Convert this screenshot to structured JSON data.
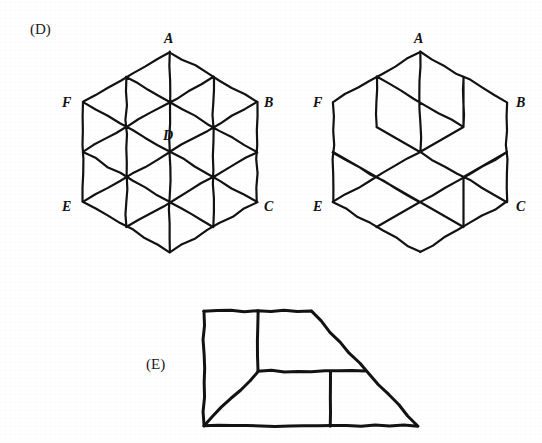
{
  "page": {
    "width": 542,
    "height": 443,
    "background_color": "#ffffff",
    "ink_color": "#121212"
  },
  "panels": [
    {
      "id": "panel-d",
      "label": "(D)",
      "label_x": 30,
      "label_y": 34
    },
    {
      "id": "panel-e",
      "label": "(E)",
      "label_y": 369,
      "label_x": 146
    }
  ],
  "figures": {
    "hexagon": {
      "name": "rhombille-hexagon",
      "stroke_width": 2.2,
      "center": {
        "x": 170,
        "y": 152
      },
      "radius": 100,
      "vertex_labels": [
        {
          "text": "A",
          "x": 164,
          "y": 43
        },
        {
          "text": "B",
          "x": 264,
          "y": 107
        },
        {
          "text": "C",
          "x": 264,
          "y": 211
        },
        {
          "text": "D",
          "x": 163,
          "y": 140
        },
        {
          "text": "E",
          "x": 62,
          "y": 211
        },
        {
          "text": "F",
          "x": 62,
          "y": 107
        }
      ],
      "outer_vertices": [
        {
          "name": "A",
          "x": 170,
          "y": 52
        },
        {
          "name": "B",
          "x": 257,
          "y": 102
        },
        {
          "name": "C",
          "x": 257,
          "y": 202
        },
        {
          "name": "S",
          "x": 170,
          "y": 252
        },
        {
          "name": "E",
          "x": 83,
          "y": 202
        },
        {
          "name": "F",
          "x": 83,
          "y": 102
        }
      ]
    },
    "cube": {
      "name": "isometric-cube",
      "stroke_width": 2.2,
      "center": {
        "x": 420,
        "y": 152
      },
      "radius": 100,
      "vertex_labels": [
        {
          "text": "A",
          "x": 414,
          "y": 43
        },
        {
          "text": "B",
          "x": 516,
          "y": 107
        },
        {
          "text": "C",
          "x": 516,
          "y": 211
        },
        {
          "text": "E",
          "x": 313,
          "y": 211
        },
        {
          "text": "F",
          "x": 313,
          "y": 107
        }
      ],
      "outer_vertices": [
        {
          "name": "A",
          "x": 420,
          "y": 52
        },
        {
          "name": "B",
          "x": 507,
          "y": 102
        },
        {
          "name": "C",
          "x": 507,
          "y": 202
        },
        {
          "name": "S",
          "x": 420,
          "y": 252
        },
        {
          "name": "E",
          "x": 333,
          "y": 202
        },
        {
          "name": "F",
          "x": 333,
          "y": 102
        }
      ]
    },
    "trapezoid": {
      "name": "trapezoid-figure",
      "stroke_width": 3.0,
      "outline": [
        {
          "x": 204,
          "y": 311
        },
        {
          "x": 311,
          "y": 311
        },
        {
          "x": 418,
          "y": 426
        },
        {
          "x": 204,
          "y": 426
        }
      ],
      "internal_lines": [
        {
          "from": {
            "x": 258,
            "y": 311
          },
          "to": {
            "x": 258,
            "y": 371
          }
        },
        {
          "from": {
            "x": 258,
            "y": 371
          },
          "to": {
            "x": 204,
            "y": 426
          }
        },
        {
          "from": {
            "x": 258,
            "y": 371
          },
          "to": {
            "x": 365,
            "y": 371
          }
        },
        {
          "from": {
            "x": 330,
            "y": 371
          },
          "to": {
            "x": 330,
            "y": 426
          }
        }
      ]
    }
  }
}
